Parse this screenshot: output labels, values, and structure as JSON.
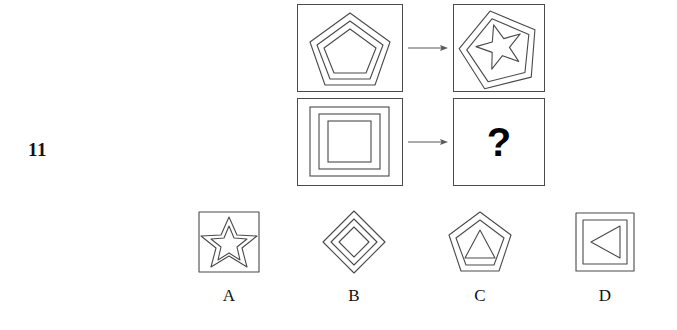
{
  "question": {
    "number": "11",
    "type": "figure-series-analogy",
    "unknown_marker": "?"
  },
  "stem": {
    "relation_label": "arrow-right",
    "rows": [
      {
        "id": "row-1",
        "left": {
          "description": "three nested pentagons inside a square frame",
          "shapes": [
            "pentagon",
            "pentagon",
            "pentagon"
          ],
          "count": 3
        },
        "right": {
          "description": "two nested rotated pentagons with a five-pointed star inside",
          "shapes": [
            "pentagon",
            "pentagon",
            "star"
          ],
          "count": 3
        }
      },
      {
        "id": "row-2",
        "left": {
          "description": "three nested squares inside a square frame",
          "shapes": [
            "square",
            "square",
            "square"
          ],
          "count": 3
        },
        "right": {
          "description": "unknown answer panel",
          "shapes": [],
          "count": 0
        }
      }
    ]
  },
  "options": [
    {
      "label": "A",
      "description": "square frame containing a double-outlined five-pointed star",
      "shapes": [
        "square",
        "star",
        "star"
      ]
    },
    {
      "label": "B",
      "description": "three nested diamonds",
      "shapes": [
        "diamond",
        "diamond",
        "diamond"
      ]
    },
    {
      "label": "C",
      "description": "two nested pentagons containing a triangle",
      "shapes": [
        "pentagon",
        "pentagon",
        "triangle"
      ]
    },
    {
      "label": "D",
      "description": "two nested squares containing a left-pointing triangle",
      "shapes": [
        "square",
        "square",
        "triangle"
      ]
    }
  ],
  "colors": {
    "background": "#ffffff",
    "stroke": "#4a4a4a",
    "text": "#111111",
    "divider": "#c9c9c9"
  }
}
